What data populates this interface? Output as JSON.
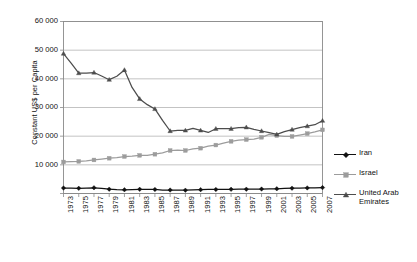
{
  "chart_data": {
    "type": "line",
    "title": "",
    "xlabel": "",
    "ylabel": "Constant US$ per Capita",
    "ylim": [
      0,
      60000
    ],
    "ytick_labels": [
      "60 000",
      "50 000",
      "40 000",
      "30 000",
      "20 000",
      "10 000",
      "0"
    ],
    "ytick_values": [
      60000,
      50000,
      40000,
      30000,
      20000,
      10000,
      0
    ],
    "grid": "horizontal",
    "legend_position": "right",
    "categories": [
      "1973",
      "1974",
      "1975",
      "1976",
      "1977",
      "1978",
      "1979",
      "1980",
      "1981",
      "1982",
      "1983",
      "1984",
      "1985",
      "1986",
      "1987",
      "1988",
      "1989",
      "1990",
      "1991",
      "1992",
      "1993",
      "1994",
      "1995",
      "1996",
      "1997",
      "1998",
      "1999",
      "2000",
      "2001",
      "2002",
      "2003",
      "2004",
      "2005",
      "2006",
      "2007"
    ],
    "xtick_labels": [
      "1973",
      "1975",
      "1977",
      "1979",
      "1981",
      "1983",
      "1985",
      "1987",
      "1989",
      "1991",
      "1993",
      "1995",
      "1997",
      "1999",
      "2001",
      "2003",
      "2005",
      "2007"
    ],
    "series": [
      {
        "name": "Iran",
        "color": "#111111",
        "marker": "diamond",
        "values": [
          1900,
          1850,
          1800,
          1900,
          2000,
          1800,
          1500,
          1350,
          1300,
          1350,
          1450,
          1400,
          1400,
          1200,
          1200,
          1150,
          1150,
          1250,
          1350,
          1400,
          1400,
          1400,
          1450,
          1500,
          1500,
          1500,
          1550,
          1600,
          1650,
          1750,
          1850,
          1900,
          1950,
          2000,
          2050
        ]
      },
      {
        "name": "Israel",
        "color": "#9c9c9c",
        "marker": "square",
        "values": [
          11000,
          11100,
          11200,
          11400,
          11700,
          12000,
          12300,
          12500,
          12900,
          13000,
          13300,
          13300,
          13700,
          14200,
          15000,
          15100,
          15000,
          15600,
          15800,
          16500,
          16900,
          17600,
          18200,
          18600,
          18800,
          19000,
          19600,
          20600,
          20200,
          19900,
          19900,
          20400,
          20900,
          21500,
          22200
        ]
      },
      {
        "name": "United Arab Emirates",
        "color": "#4d4d4d",
        "marker": "triangle",
        "values": [
          48800,
          45500,
          42000,
          42000,
          42200,
          41000,
          39700,
          40900,
          43100,
          37000,
          33000,
          31000,
          29500,
          25500,
          21800,
          22000,
          22000,
          22700,
          22000,
          21300,
          22600,
          22600,
          22600,
          23000,
          23100,
          22400,
          21800,
          21200,
          20600,
          21600,
          22300,
          23000,
          23500,
          24000,
          25400
        ]
      }
    ]
  },
  "legend": {
    "items": [
      {
        "label": "Iran"
      },
      {
        "label": "Israel"
      },
      {
        "label": "United Arab\nEmirates"
      }
    ]
  }
}
